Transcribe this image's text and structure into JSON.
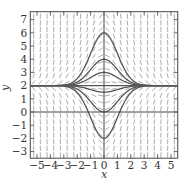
{
  "chart_data": {
    "type": "line",
    "title": "",
    "subtitle": "Slope field with solution curves",
    "equation_hint": "y' = -x(y - 2)",
    "xlabel": "x",
    "ylabel": "y",
    "xlim": [
      -5.5,
      5.5
    ],
    "ylim": [
      -3.5,
      7.6
    ],
    "x_ticks": [
      -5,
      -4,
      -3,
      -2,
      -1,
      0,
      1,
      2,
      3,
      4,
      5
    ],
    "y_ticks": [
      -3,
      -2,
      -1,
      0,
      1,
      2,
      3,
      4,
      5,
      6,
      7
    ],
    "x_tick_labels": [
      "−5",
      "−4",
      "−3",
      "−2",
      "−1",
      "0",
      "1",
      "2",
      "3",
      "4",
      "5"
    ],
    "y_tick_labels": [
      "−3",
      "−2",
      "−1",
      "0",
      "1",
      "2",
      "3",
      "4",
      "5",
      "6",
      "7"
    ],
    "grid": false,
    "slope_field": {
      "x_step": 0.5,
      "y_step": 0.5
    },
    "equilibrium": 2,
    "series": [
      {
        "name": "y(0)=6",
        "y0": 6
      },
      {
        "name": "y(0)=4",
        "y0": 4
      },
      {
        "name": "y(0)=3",
        "y0": 3
      },
      {
        "name": "y(0)=2",
        "y0": 2
      },
      {
        "name": "y(0)=1.5",
        "y0": 1.5
      },
      {
        "name": "y(0)=0",
        "y0": 0
      },
      {
        "name": "y(0)=-2",
        "y0": -2
      }
    ],
    "colors": {
      "curves": "#555555",
      "slopes": "#8a8a8a",
      "axes": "#444444",
      "frame": "#555555"
    }
  }
}
